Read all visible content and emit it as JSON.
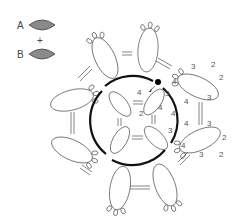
{
  "legend": {
    "items": [
      {
        "label": "A",
        "icon": "shuttle-icon",
        "color": "#8a8a8a"
      },
      {
        "label": "B",
        "icon": "shuttle-icon",
        "color": "#8a8a8a"
      }
    ],
    "joiner": "+"
  },
  "diagram": {
    "type": "tatting-pattern",
    "center": {
      "inner_rings": 4,
      "ring_labels": [
        "4",
        "4",
        "2"
      ]
    },
    "chain_labels": [
      "3",
      "4",
      "4",
      "3"
    ],
    "petals": 6,
    "petal_labels": {
      "upper_right": [
        "3",
        "2",
        "2",
        "3",
        "4"
      ],
      "lower_right": [
        "4",
        "3",
        "2",
        "2",
        "3",
        "4"
      ]
    },
    "start_marker": "dot"
  }
}
